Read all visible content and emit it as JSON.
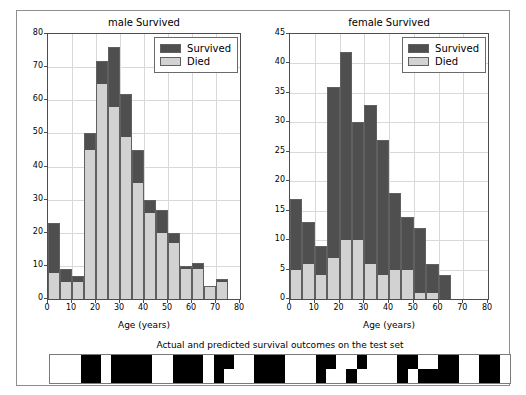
{
  "figure": {
    "background": "#ffffff",
    "frame_color": "#8e8e8e"
  },
  "colors": {
    "survived": "#4f4f4f",
    "died": "#d2d2d2",
    "grid": "#d8d8d8",
    "axis": "#4d4d4d",
    "heat_true": "#000000",
    "heat_false": "#ffffff"
  },
  "legend": {
    "survived_label": "Survived",
    "died_label": "Died"
  },
  "strip": {
    "title": "Actual and predicted survival outcomes on the test set",
    "row_names": [
      "actual",
      "predicted"
    ]
  },
  "chart_data": [
    {
      "type": "bar",
      "id": "male",
      "title": "male Survived",
      "xlabel": "Age (years)",
      "ylabel": "",
      "stacked": true,
      "grid": true,
      "legend_position": "upper right",
      "xlim": [
        0,
        80
      ],
      "ylim": [
        0,
        80
      ],
      "xticks": [
        0,
        10,
        20,
        30,
        40,
        50,
        60,
        70,
        80
      ],
      "yticks": [
        0,
        10,
        20,
        30,
        40,
        50,
        60,
        70,
        80
      ],
      "bin_width": 5,
      "bin_edges": [
        0,
        5,
        10,
        15,
        20,
        25,
        30,
        35,
        40,
        45,
        50,
        55,
        60,
        65,
        70,
        75
      ],
      "categories": [
        "0-5",
        "5-10",
        "10-15",
        "15-20",
        "20-25",
        "25-30",
        "30-35",
        "35-40",
        "40-45",
        "45-50",
        "50-55",
        "55-60",
        "60-65",
        "65-70",
        "70-75"
      ],
      "series": [
        {
          "name": "Died",
          "values": [
            8,
            5,
            5,
            45,
            65,
            58,
            49,
            35,
            26,
            20,
            17,
            9,
            9,
            4,
            5
          ]
        },
        {
          "name": "Survived",
          "values": [
            15,
            4,
            2,
            5,
            7,
            18,
            13,
            10,
            4,
            7,
            3,
            1,
            2,
            0,
            1
          ]
        }
      ],
      "totals": [
        23,
        9,
        7,
        50,
        72,
        76,
        62,
        45,
        30,
        27,
        20,
        10,
        11,
        4,
        6
      ]
    },
    {
      "type": "bar",
      "id": "female",
      "title": "female Survived",
      "xlabel": "Age (years)",
      "ylabel": "",
      "stacked": true,
      "grid": true,
      "legend_position": "upper right",
      "xlim": [
        0,
        80
      ],
      "ylim": [
        0,
        45
      ],
      "xticks": [
        0,
        10,
        20,
        30,
        40,
        50,
        60,
        70,
        80
      ],
      "yticks": [
        0,
        5,
        10,
        15,
        20,
        25,
        30,
        35,
        40,
        45
      ],
      "bin_width": 5,
      "bin_edges": [
        0,
        5,
        10,
        15,
        20,
        25,
        30,
        35,
        40,
        45,
        50,
        55,
        60
      ],
      "categories": [
        "0-5",
        "5-10",
        "10-15",
        "15-20",
        "20-25",
        "25-30",
        "30-35",
        "35-40",
        "40-45",
        "45-50",
        "50-55",
        "55-60",
        "60-65"
      ],
      "series": [
        {
          "name": "Died",
          "values": [
            5,
            6,
            4,
            7,
            10,
            10,
            6,
            4,
            5,
            5,
            1,
            1,
            0
          ]
        },
        {
          "name": "Survived",
          "values": [
            12,
            7,
            5,
            29,
            32,
            20,
            27,
            23,
            13,
            9,
            11,
            5,
            4
          ]
        }
      ],
      "totals": [
        17,
        13,
        9,
        36,
        42,
        30,
        33,
        27,
        18,
        14,
        12,
        6,
        4
      ]
    },
    {
      "type": "heatmap",
      "id": "outcomes-strip",
      "title": "Actual and predicted survival outcomes on the test set",
      "rows": [
        "actual",
        "predicted"
      ],
      "n_cols": 45,
      "values": [
        [
          0,
          0,
          0,
          1,
          1,
          0,
          1,
          1,
          1,
          1,
          0,
          0,
          1,
          1,
          1,
          0,
          1,
          1,
          0,
          0,
          1,
          1,
          1,
          0,
          0,
          0,
          1,
          1,
          0,
          0,
          1,
          0,
          0,
          0,
          1,
          1,
          0,
          0,
          1,
          1,
          0,
          0,
          1,
          1,
          0
        ],
        [
          0,
          0,
          0,
          1,
          1,
          0,
          1,
          1,
          1,
          1,
          0,
          0,
          1,
          1,
          1,
          0,
          1,
          0,
          0,
          0,
          1,
          1,
          1,
          0,
          0,
          0,
          1,
          0,
          0,
          1,
          0,
          0,
          0,
          0,
          1,
          0,
          1,
          1,
          1,
          1,
          0,
          0,
          1,
          1,
          0
        ]
      ]
    }
  ]
}
